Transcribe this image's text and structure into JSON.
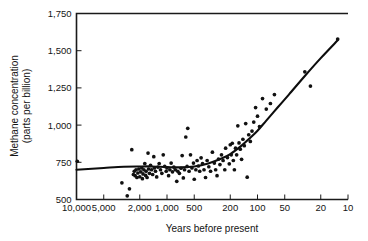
{
  "chart_data": {
    "type": "scatter",
    "title": "",
    "subtitle": "",
    "xlabel": "Years before present",
    "ylabel": "Methane concentration\n(parts per billion)",
    "ylabel_line1": "Methane concentration",
    "ylabel_line2": "(parts per billion)",
    "grid": false,
    "legend": "none",
    "x_scale": "log-reversed",
    "y_scale": "linear",
    "xlim": [
      10000,
      10
    ],
    "ylim": [
      500,
      1750
    ],
    "x_tick_labels": [
      "10,000",
      "5,000",
      "2,000",
      "1,000",
      "500",
      "200",
      "100",
      "50",
      "20",
      "10"
    ],
    "x_tick_values": [
      10000,
      5000,
      2000,
      1000,
      500,
      200,
      100,
      50,
      20,
      10
    ],
    "y_tick_labels": [
      "500",
      "750",
      "1,000",
      "1,250",
      "1,500",
      "1,750"
    ],
    "y_tick_values": [
      500,
      750,
      1000,
      1250,
      1500,
      1750
    ],
    "series": [
      {
        "name": "Ice-core methane measurements",
        "marker": "filled-circle",
        "color": "#111111",
        "points": [
          [
            9800,
            757
          ],
          [
            3150,
            612
          ],
          [
            2750,
            525
          ],
          [
            2600,
            572
          ],
          [
            2450,
            835
          ],
          [
            2350,
            668
          ],
          [
            2300,
            690
          ],
          [
            2250,
            660
          ],
          [
            2200,
            700
          ],
          [
            2150,
            648
          ],
          [
            2100,
            678
          ],
          [
            2050,
            705
          ],
          [
            2000,
            653
          ],
          [
            1950,
            686
          ],
          [
            1900,
            712
          ],
          [
            1870,
            640
          ],
          [
            1840,
            672
          ],
          [
            1800,
            700
          ],
          [
            1760,
            742
          ],
          [
            1720,
            662
          ],
          [
            1700,
            690
          ],
          [
            1660,
            648
          ],
          [
            1620,
            812
          ],
          [
            1600,
            705
          ],
          [
            1560,
            676
          ],
          [
            1520,
            730
          ],
          [
            1480,
            700
          ],
          [
            1440,
            668
          ],
          [
            1400,
            788
          ],
          [
            1380,
            712
          ],
          [
            1340,
            690
          ],
          [
            1300,
            652
          ],
          [
            1260,
            718
          ],
          [
            1220,
            742
          ],
          [
            1180,
            700
          ],
          [
            1140,
            676
          ],
          [
            1100,
            800
          ],
          [
            1060,
            722
          ],
          [
            1020,
            690
          ],
          [
            1000,
            712
          ],
          [
            960,
            660
          ],
          [
            930,
            700
          ],
          [
            900,
            745
          ],
          [
            870,
            686
          ],
          [
            840,
            718
          ],
          [
            810,
            700
          ],
          [
            780,
            622
          ],
          [
            760,
            690
          ],
          [
            730,
            676
          ],
          [
            700,
            710
          ],
          [
            680,
            795
          ],
          [
            660,
            645
          ],
          [
            640,
            700
          ],
          [
            620,
            920
          ],
          [
            600,
            722
          ],
          [
            590,
            978
          ],
          [
            570,
            690
          ],
          [
            550,
            800
          ],
          [
            530,
            712
          ],
          [
            510,
            745
          ],
          [
            500,
            636
          ],
          [
            480,
            700
          ],
          [
            465,
            762
          ],
          [
            450,
            725
          ],
          [
            435,
            690
          ],
          [
            420,
            780
          ],
          [
            405,
            742
          ],
          [
            390,
            700
          ],
          [
            375,
            648
          ],
          [
            360,
            762
          ],
          [
            345,
            720
          ],
          [
            330,
            690
          ],
          [
            315,
            818
          ],
          [
            300,
            745
          ],
          [
            290,
            700
          ],
          [
            280,
            660
          ],
          [
            270,
            772
          ],
          [
            260,
            735
          ],
          [
            250,
            800
          ],
          [
            240,
            762
          ],
          [
            230,
            700
          ],
          [
            225,
            845
          ],
          [
            215,
            782
          ],
          [
            205,
            740
          ],
          [
            200,
            868
          ],
          [
            195,
            800
          ],
          [
            190,
            878
          ],
          [
            185,
            762
          ],
          [
            180,
            700
          ],
          [
            175,
            845
          ],
          [
            170,
            800
          ],
          [
            165,
            995
          ],
          [
            160,
            880
          ],
          [
            155,
            838
          ],
          [
            150,
            770
          ],
          [
            145,
            905
          ],
          [
            140,
            862
          ],
          [
            135,
            1010
          ],
          [
            130,
            650
          ],
          [
            125,
            935
          ],
          [
            120,
            890
          ],
          [
            115,
            960
          ],
          [
            110,
            1020
          ],
          [
            105,
            1118
          ],
          [
            100,
            1060
          ],
          [
            95,
            990
          ],
          [
            88,
            1178
          ],
          [
            80,
            1108
          ],
          [
            72,
            1145
          ],
          [
            65,
            1205
          ],
          [
            30,
            1358
          ],
          [
            26,
            1262
          ],
          [
            13,
            1578
          ]
        ]
      }
    ],
    "fit_curve": {
      "name": "Smoothed trend line",
      "color": "#0d0d0d",
      "points": [
        [
          10000,
          700
        ],
        [
          5000,
          712
        ],
        [
          3000,
          720
        ],
        [
          2000,
          722
        ],
        [
          1500,
          722
        ],
        [
          1000,
          718
        ],
        [
          700,
          716
        ],
        [
          500,
          722
        ],
        [
          350,
          742
        ],
        [
          250,
          775
        ],
        [
          200,
          805
        ],
        [
          150,
          862
        ],
        [
          120,
          915
        ],
        [
          100,
          962
        ],
        [
          80,
          1030
        ],
        [
          60,
          1118
        ],
        [
          45,
          1205
        ],
        [
          30,
          1330
        ],
        [
          20,
          1450
        ],
        [
          13,
          1570
        ]
      ]
    },
    "annotations": []
  },
  "axes": {
    "x_axis_name": "years-before-present-axis",
    "y_axis_name": "methane-concentration-axis"
  }
}
